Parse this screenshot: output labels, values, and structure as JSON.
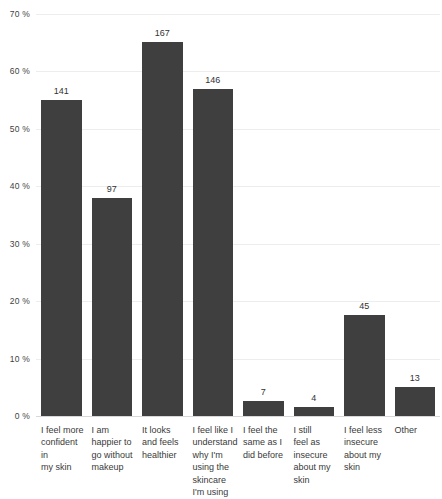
{
  "chart_data": {
    "type": "bar",
    "title": "",
    "subtitle": "",
    "xlabel": "",
    "ylabel": "",
    "grid": true,
    "legend": false,
    "orientation": "vertical",
    "value_label_position": "above-bar",
    "bar_color": "#3f3f3f",
    "gridline_color": "#ededed",
    "background_color": "#ffffff",
    "ylim": [
      0,
      70
    ],
    "y_unit": "%",
    "y_tick_labels": [
      "70 %",
      "60 %",
      "50 %",
      "40 %",
      "30 %",
      "20 %",
      "10 %",
      "0 %"
    ],
    "y_tick_values": [
      70,
      60,
      50,
      40,
      30,
      20,
      10,
      0
    ],
    "categories": [
      "I feel more confident in my skin",
      "I am happier to go without makeup",
      "It looks and feels healthier",
      "I feel like I understand why I'm using the skincare I'm using",
      "I feel the same as I did before",
      "I still feel as insecure about my skin",
      "I feel less insecure about my skin",
      "Other"
    ],
    "counts": [
      141,
      97,
      167,
      146,
      7,
      4,
      45,
      13
    ],
    "values": [
      55.1,
      37.9,
      65.2,
      57.0,
      2.7,
      1.6,
      17.6,
      5.1
    ],
    "data_labels": [
      "141",
      "97",
      "167",
      "146",
      "7",
      "4",
      "45",
      "13"
    ]
  },
  "x_label_lines": [
    [
      "I feel more",
      "confident in",
      "my skin"
    ],
    [
      "I am",
      "happier to",
      "go without",
      "makeup"
    ],
    [
      "It looks",
      "and feels",
      "healthier"
    ],
    [
      "I feel like I",
      "understand",
      "why I'm",
      "using the",
      "skincare",
      "I'm using"
    ],
    [
      "I feel the",
      "same as I",
      "did before"
    ],
    [
      "I still",
      "feel as",
      "insecure",
      "about my",
      "skin"
    ],
    [
      "I feel less",
      "insecure",
      "about my",
      "skin"
    ],
    [
      "Other"
    ]
  ]
}
